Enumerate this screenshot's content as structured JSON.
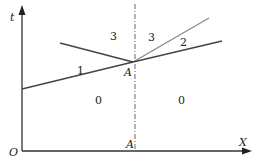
{
  "diagram": {
    "axes": {
      "vertical_label": "t",
      "horizontal_label": "X",
      "origin_label": "O"
    },
    "point": {
      "label": "A",
      "axis_projection_label": "A"
    },
    "regions": {
      "r1": "1",
      "r2": "2",
      "r3_left": "3",
      "r3_right": "3",
      "r0_left": "0",
      "r0_right": "0"
    },
    "colors": {
      "axis": "#333333",
      "line_dark": "#444444",
      "line_light": "#888888",
      "dashdot": "#666666"
    }
  }
}
